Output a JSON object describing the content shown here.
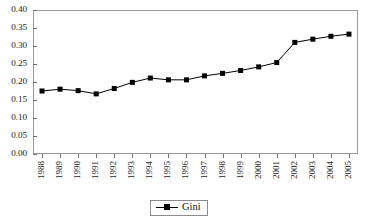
{
  "chart_data": {
    "type": "line",
    "title": "",
    "subtitle": "",
    "xlabel": "",
    "ylabel": "",
    "categories": [
      "1988",
      "1989",
      "1990",
      "1991",
      "1992",
      "1993",
      "1994",
      "1995",
      "1996",
      "1997",
      "1998",
      "1999",
      "2000",
      "2001",
      "2002",
      "2003",
      "2004",
      "2005"
    ],
    "series": [
      {
        "name": "Gini",
        "color": "#000000",
        "marker": "square",
        "values": [
          0.175,
          0.18,
          0.176,
          0.167,
          0.182,
          0.199,
          0.211,
          0.206,
          0.206,
          0.217,
          0.224,
          0.232,
          0.242,
          0.254,
          0.31,
          0.319,
          0.327,
          0.333
        ]
      }
    ],
    "ylim": [
      0.0,
      0.4
    ],
    "ytick_step": 0.05,
    "ytick_labels": [
      "0.00",
      "0.05",
      "0.10",
      "0.15",
      "0.20",
      "0.25",
      "0.30",
      "0.35",
      "0.40"
    ],
    "ytick_values": [
      0.0,
      0.05,
      0.1,
      0.15,
      0.2,
      0.25,
      0.3,
      0.35,
      0.4
    ],
    "grid": false,
    "frame": true,
    "legend_position": "bottom-center",
    "legend_entries": [
      "Gini"
    ],
    "xtick_rotation": 90
  },
  "legend": {
    "gini_label": "Gini"
  },
  "colors": {
    "series": "#000000",
    "frame": "#9a9a9a",
    "tick": "#6f6f6f",
    "background": "#ffffff"
  }
}
